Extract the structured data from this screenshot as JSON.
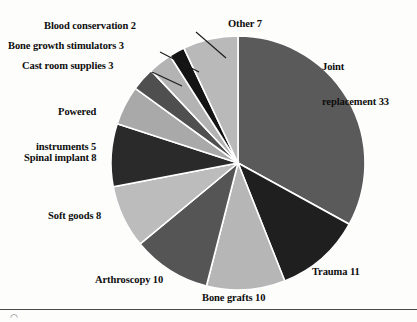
{
  "chart_data": {
    "type": "pie",
    "title": "",
    "subtitle": "",
    "xlabel": "",
    "ylabel": "",
    "legend_position": "none",
    "labels_position": "outside-with-leader-lines",
    "grid": false,
    "start_angle_deg": 0,
    "direction": "clockwise",
    "total": 100,
    "units": "percent",
    "categories": [
      "Joint replacement",
      "Trauma",
      "Bone grafts",
      "Arthroscopy",
      "Soft goods",
      "Spinal implant",
      "Powered instruments",
      "Cast room supplies",
      "Bone growth stimulators",
      "Blood conservation",
      "Other"
    ],
    "values": [
      33,
      11,
      10,
      10,
      8,
      8,
      5,
      3,
      3,
      2,
      7
    ],
    "slice_colors": [
      "#5a5a5a",
      "#1f1f1f",
      "#b6b6b6",
      "#555555",
      "#bcbcbc",
      "#2a2a2a",
      "#a9a9a9",
      "#4f4f4f",
      "#b3b3b3",
      "#141414",
      "#b9b9b9"
    ],
    "slices": [
      {
        "label": "Joint replacement",
        "value": 33,
        "display": "Joint\nreplacement 33",
        "color": "#5a5a5a"
      },
      {
        "label": "Trauma",
        "value": 11,
        "display": "Trauma 11",
        "color": "#1f1f1f"
      },
      {
        "label": "Bone grafts",
        "value": 10,
        "display": "Bone grafts 10",
        "color": "#b6b6b6"
      },
      {
        "label": "Arthroscopy",
        "value": 10,
        "display": "Arthroscopy 10",
        "color": "#555555"
      },
      {
        "label": "Soft goods",
        "value": 8,
        "display": "Soft goods 8",
        "color": "#bcbcbc"
      },
      {
        "label": "Spinal implant",
        "value": 8,
        "display": "Spinal implant 8",
        "color": "#2a2a2a"
      },
      {
        "label": "Powered instruments",
        "value": 5,
        "display": "Powered\ninstruments 5",
        "color": "#a9a9a9"
      },
      {
        "label": "Cast room supplies",
        "value": 3,
        "display": "Cast room supplies 3",
        "color": "#4f4f4f"
      },
      {
        "label": "Bone growth stimulators",
        "value": 3,
        "display": "Bone growth stimulators 3",
        "color": "#b3b3b3"
      },
      {
        "label": "Blood conservation",
        "value": 2,
        "display": "Blood conservation 2",
        "color": "#141414"
      },
      {
        "label": "Other",
        "value": 7,
        "display": "Other 7",
        "color": "#b9b9b9"
      }
    ]
  },
  "labels": {
    "joint_replacement_line1": "Joint",
    "joint_replacement_line2": "replacement 33",
    "trauma": "Trauma 11",
    "bone_grafts": "Bone grafts 10",
    "arthroscopy": "Arthroscopy 10",
    "soft_goods": "Soft goods 8",
    "spinal_implant": "Spinal implant 8",
    "powered_instruments_line1": "Powered",
    "powered_instruments_line2": "instruments 5",
    "cast_room_supplies": "Cast room supplies 3",
    "bone_growth_stimulators": "Bone growth stimulators 3",
    "blood_conservation": "Blood conservation 2",
    "other": "Other 7"
  },
  "figure": {
    "corner_mark": "◠"
  }
}
